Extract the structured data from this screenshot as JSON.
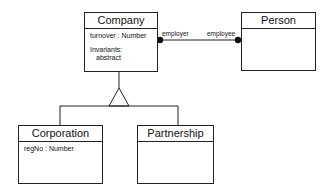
{
  "diagram": {
    "type": "UML class diagram",
    "classes": [
      {
        "id": "company",
        "name": "Company",
        "attributes": [
          "turnover : Number"
        ],
        "invariants_label": "Invariants:",
        "invariants": [
          "abstract"
        ]
      },
      {
        "id": "person",
        "name": "Person",
        "attributes": []
      },
      {
        "id": "corporation",
        "name": "Corporation",
        "attributes": [
          "regNo : Number"
        ]
      },
      {
        "id": "partnership",
        "name": "Partnership",
        "attributes": []
      }
    ],
    "associations": [
      {
        "from": "Company",
        "to": "Person",
        "from_role": "employer",
        "to_role": "employee",
        "end_style": "filled-dot"
      }
    ],
    "generalizations": [
      {
        "parent": "Company",
        "children": [
          "Corporation",
          "Partnership"
        ],
        "marker": "hollow-triangle"
      }
    ],
    "colors": {
      "line": "#222222",
      "background": "#ffffff"
    }
  }
}
